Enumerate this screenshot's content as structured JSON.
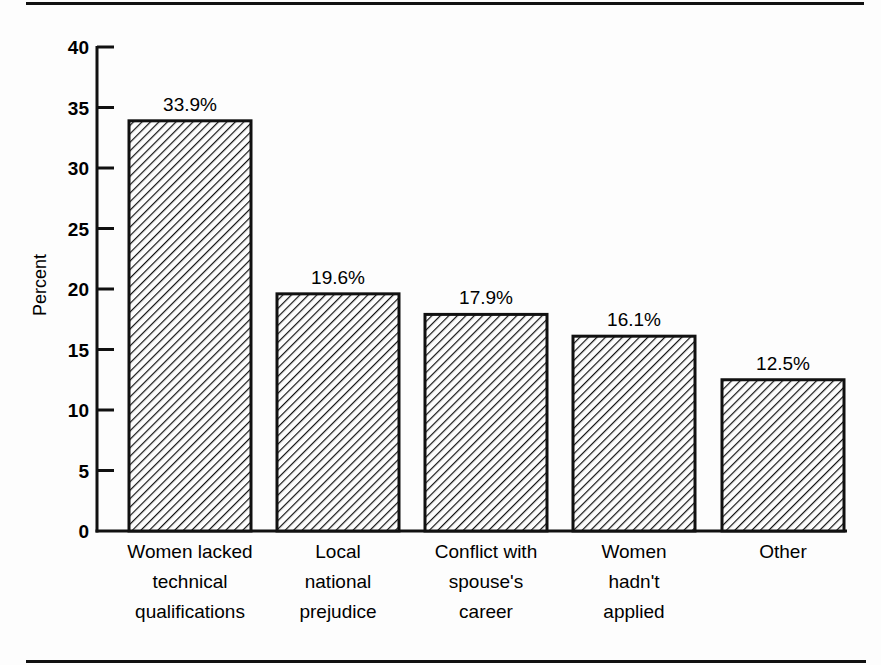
{
  "chart_data": {
    "type": "bar",
    "title": "",
    "xlabel": "",
    "ylabel": "Percent",
    "ylim": [
      0,
      40
    ],
    "yticks": [
      0,
      5,
      10,
      15,
      20,
      25,
      30,
      35,
      40
    ],
    "grid": false,
    "legend": null,
    "pattern": "diagonal-hatch",
    "categories": [
      [
        "Women lacked",
        "technical",
        "qualifications"
      ],
      [
        "Local",
        "national",
        "prejudice"
      ],
      [
        "Conflict with",
        "spouse's",
        "career"
      ],
      [
        "Women",
        "hadn't",
        "applied"
      ],
      [
        "Other"
      ]
    ],
    "values": [
      33.9,
      19.6,
      17.9,
      16.1,
      12.5
    ],
    "value_labels": [
      "33.9%",
      "19.6%",
      "17.9%",
      "16.1%",
      "12.5%"
    ]
  },
  "colors": {
    "ink": "#111111",
    "background": "#fdfdfd"
  }
}
